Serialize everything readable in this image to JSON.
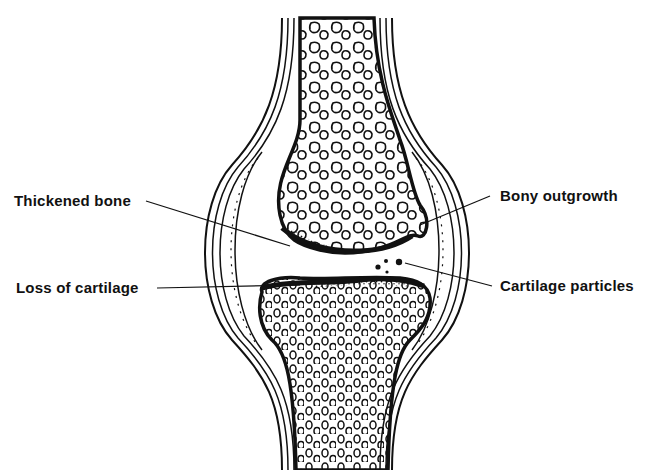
{
  "diagram": {
    "colors": {
      "ink": "#111111",
      "background": "#ffffff"
    },
    "labels": [
      {
        "id": "thickened-bone",
        "text": "Thickened bone",
        "side": "left"
      },
      {
        "id": "loss-of-cartilage",
        "text": "Loss of cartilage",
        "side": "left"
      },
      {
        "id": "bony-outgrowth",
        "text": "Bony outgrowth",
        "side": "right"
      },
      {
        "id": "cartilage-particles",
        "text": "Cartilage particles",
        "side": "right"
      }
    ]
  }
}
